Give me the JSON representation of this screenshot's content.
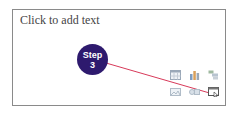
{
  "slide": {
    "placeholder_text": "Click to add text"
  },
  "callout": {
    "label_line1": "Step",
    "label_line2": "3",
    "color": "#2e1a6e",
    "line_color": "#d83a5a"
  },
  "content_icons": [
    {
      "name": "insert-table-icon"
    },
    {
      "name": "insert-chart-icon"
    },
    {
      "name": "insert-smartart-icon"
    },
    {
      "name": "insert-picture-icon"
    },
    {
      "name": "insert-online-picture-icon"
    },
    {
      "name": "insert-video-icon"
    }
  ]
}
